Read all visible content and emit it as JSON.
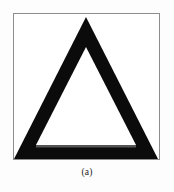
{
  "figure": {
    "caption": "(a)",
    "panel": {
      "border_color": "#8d8d8d",
      "background_color": "#ffffff",
      "width_px": 147,
      "height_px": 147
    },
    "background_color": "#fdfdfd",
    "shape": {
      "name": "triangle-outline",
      "description": "thick black outlined triangle with blunt apex",
      "stroke_color": "#0b0b0b",
      "fill_color": "#ffffff",
      "apex_x": 72,
      "apex_y": 4,
      "base_left_x": 3,
      "base_right_x": 142,
      "base_y": 144,
      "stroke_width_px": 17,
      "inner_apex_y": 33,
      "inner_base_y": 132
    }
  }
}
